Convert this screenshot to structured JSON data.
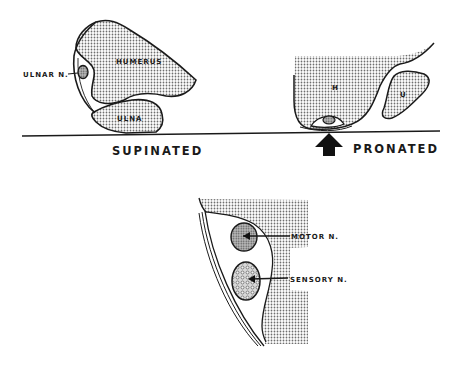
{
  "diagram": {
    "top_left": {
      "caption": "SUPINATED",
      "labels": {
        "humerus": "HUMERUS",
        "ulna": "ULNA",
        "ulnar_nerve": "ULNAR N."
      }
    },
    "top_right": {
      "caption": "PRONATED",
      "labels": {
        "humerus": "H",
        "ulna": "U"
      },
      "arrow": "pressure-arrow-up"
    },
    "bottom": {
      "labels": {
        "motor": "MOTOR N.",
        "sensory": "SENSORY N."
      }
    },
    "colors": {
      "ink": "#1a1a1a",
      "stipple": "#8a8a8a",
      "background": "#ffffff"
    }
  }
}
